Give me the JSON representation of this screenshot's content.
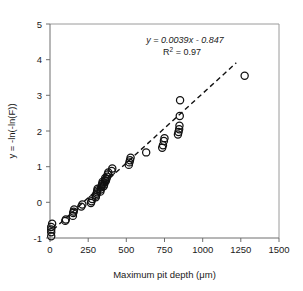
{
  "chart_data": {
    "type": "scatter",
    "title": "",
    "xlabel": "Maximum pit depth (μm)",
    "ylabel": "y = -ln(-ln(F))",
    "xlim": [
      0,
      1500
    ],
    "ylim": [
      -1,
      5
    ],
    "xticks": [
      0,
      250,
      500,
      750,
      1000,
      1250,
      1500
    ],
    "yticks": [
      -1,
      0,
      1,
      2,
      3,
      4,
      5
    ],
    "grid": false,
    "legend": null,
    "marker_style": "open-circle",
    "annotations": {
      "equation": "y = 0.0039x - 0.847",
      "r_squared_label": "R",
      "r_squared_exponent": "2",
      "r_squared_value": "= 0.97",
      "r_squared_full": "R2 = 0.97"
    },
    "trendline": {
      "style": "dashed",
      "slope": 0.0039,
      "intercept": -0.847,
      "r_squared": 0.97,
      "x_start": 20,
      "x_end": 1220
    },
    "points": [
      {
        "x": 8,
        "y": -0.95
      },
      {
        "x": 8,
        "y": -0.84
      },
      {
        "x": 8,
        "y": -0.76
      },
      {
        "x": 8,
        "y": -0.69
      },
      {
        "x": 14,
        "y": -0.6
      },
      {
        "x": 100,
        "y": -0.52
      },
      {
        "x": 104,
        "y": -0.48
      },
      {
        "x": 150,
        "y": -0.38
      },
      {
        "x": 152,
        "y": -0.3
      },
      {
        "x": 155,
        "y": -0.26
      },
      {
        "x": 158,
        "y": -0.2
      },
      {
        "x": 205,
        "y": -0.12
      },
      {
        "x": 212,
        "y": -0.06
      },
      {
        "x": 268,
        "y": -0.02
      },
      {
        "x": 272,
        "y": 0.03
      },
      {
        "x": 276,
        "y": 0.09
      },
      {
        "x": 300,
        "y": 0.14
      },
      {
        "x": 302,
        "y": 0.19
      },
      {
        "x": 305,
        "y": 0.24
      },
      {
        "x": 308,
        "y": 0.28
      },
      {
        "x": 310,
        "y": 0.33
      },
      {
        "x": 312,
        "y": 0.38
      },
      {
        "x": 330,
        "y": 0.3
      },
      {
        "x": 333,
        "y": 0.36
      },
      {
        "x": 336,
        "y": 0.42
      },
      {
        "x": 339,
        "y": 0.47
      },
      {
        "x": 342,
        "y": 0.52
      },
      {
        "x": 345,
        "y": 0.58
      },
      {
        "x": 352,
        "y": 0.45
      },
      {
        "x": 355,
        "y": 0.5
      },
      {
        "x": 358,
        "y": 0.56
      },
      {
        "x": 360,
        "y": 0.62
      },
      {
        "x": 362,
        "y": 0.68
      },
      {
        "x": 366,
        "y": 0.6
      },
      {
        "x": 370,
        "y": 0.66
      },
      {
        "x": 374,
        "y": 0.72
      },
      {
        "x": 378,
        "y": 0.78
      },
      {
        "x": 382,
        "y": 0.84
      },
      {
        "x": 404,
        "y": 0.88
      },
      {
        "x": 408,
        "y": 0.95
      },
      {
        "x": 516,
        "y": 1.05
      },
      {
        "x": 520,
        "y": 1.12
      },
      {
        "x": 524,
        "y": 1.18
      },
      {
        "x": 528,
        "y": 1.25
      },
      {
        "x": 630,
        "y": 1.4
      },
      {
        "x": 735,
        "y": 1.53
      },
      {
        "x": 740,
        "y": 1.6
      },
      {
        "x": 746,
        "y": 1.72
      },
      {
        "x": 750,
        "y": 1.8
      },
      {
        "x": 838,
        "y": 1.9
      },
      {
        "x": 842,
        "y": 1.97
      },
      {
        "x": 846,
        "y": 2.05
      },
      {
        "x": 848,
        "y": 2.15
      },
      {
        "x": 850,
        "y": 2.42
      },
      {
        "x": 852,
        "y": 2.86
      },
      {
        "x": 1275,
        "y": 3.55
      }
    ]
  }
}
